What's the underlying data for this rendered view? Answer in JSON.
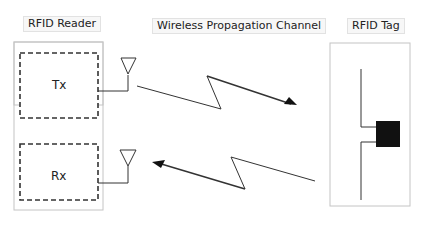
{
  "labels": {
    "reader": "RFID Reader",
    "channel": "Wireless Propagation Channel",
    "tag": "RFID Tag"
  },
  "reader": {
    "tx": "Tx",
    "rx": "Rx"
  },
  "colors": {
    "stroke": "#333333",
    "outline": "#bbbbbb",
    "chip": "#111111"
  }
}
